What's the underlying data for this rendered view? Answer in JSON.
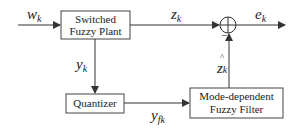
{
  "diagram": {
    "type": "block-diagram",
    "blocks": {
      "plant": {
        "line1": "Switched",
        "line2": "Fuzzy Plant"
      },
      "quantizer": {
        "label": "Quantizer"
      },
      "filter": {
        "line1": "Mode-dependent",
        "line2": "Fuzzy Filter"
      }
    },
    "signals": {
      "input": {
        "base": "w",
        "sub": "k"
      },
      "plant_output_z": {
        "base": "z",
        "sub": "k"
      },
      "error": {
        "base": "e",
        "sub": "k"
      },
      "measured": {
        "base": "y",
        "sub": "k"
      },
      "quantized": {
        "base": "y",
        "sub": "fk"
      },
      "estimate": {
        "hat": "^",
        "base": "z",
        "sub": "k"
      }
    },
    "junction": {
      "type": "sum",
      "minus_sign": "−"
    },
    "edges": [
      {
        "from": "input",
        "to": "plant",
        "label": "w_k"
      },
      {
        "from": "plant",
        "to": "sum",
        "label": "z_k"
      },
      {
        "from": "sum",
        "to": "output",
        "label": "e_k"
      },
      {
        "from": "plant",
        "to": "quantizer",
        "label": "y_k"
      },
      {
        "from": "quantizer",
        "to": "filter",
        "label": "y_fk"
      },
      {
        "from": "filter",
        "to": "sum",
        "label": "ẑ_k",
        "sign": "-"
      }
    ]
  }
}
